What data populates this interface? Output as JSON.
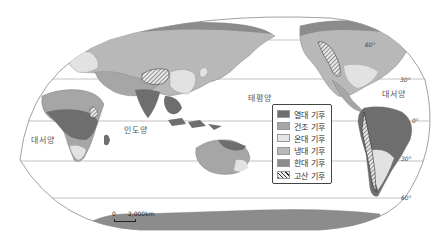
{
  "map": {
    "type": "world climate zones map",
    "colors": {
      "tropical": "#6e6e6e",
      "arid": "#a6a6a6",
      "temperate": "#e2e2e2",
      "continental": "#b8b8b8",
      "polar": "#8c8c8c",
      "highland": "#d4d4d4",
      "ocean": "#ffffff",
      "grid": "#9a9a9a"
    }
  },
  "oceans": {
    "atlantic_left": "대서양",
    "indian": "인도양",
    "pacific": "태평양",
    "atlantic_right": "대서양"
  },
  "latitudes": {
    "n60": "60°",
    "n30": "30°",
    "eq": "0°",
    "s30": "30°",
    "s60": "60°"
  },
  "legend": {
    "items": [
      {
        "label": "열대 기후",
        "key": "tropical"
      },
      {
        "label": "건조 기후",
        "key": "arid"
      },
      {
        "label": "온대 기후",
        "key": "temperate"
      },
      {
        "label": "냉대 기후",
        "key": "continental"
      },
      {
        "label": "한대 기후",
        "key": "polar"
      },
      {
        "label": "고산 기후",
        "key": "highland"
      }
    ]
  },
  "scale": {
    "zero": "0",
    "distance": "2,000km"
  }
}
